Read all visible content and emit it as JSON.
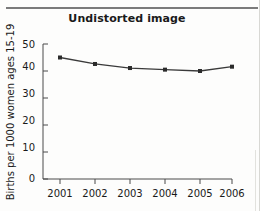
{
  "figure": {
    "title": "Undistorted image",
    "background_color": "#fdfdfc",
    "rule_color": "#7b7b7b"
  },
  "chart_data": {
    "type": "line",
    "title": "Undistorted image",
    "xlabel": "",
    "ylabel": "Births per 1000 women ages 15-19",
    "categories": [
      "2001",
      "2002",
      "2003",
      "2004",
      "2005",
      "2006"
    ],
    "x": [
      2001,
      2002,
      2003,
      2004,
      2005,
      2006
    ],
    "values": [
      45.0,
      42.6,
      41.1,
      40.5,
      40.0,
      41.6
    ],
    "series": [
      {
        "name": "Births per 1000 women ages 15-19",
        "values": [
          45.0,
          42.6,
          41.1,
          40.5,
          40.0,
          41.6
        ],
        "line_color": "#3a3a3a",
        "marker_color": "#2b2b2b",
        "marker": "square"
      }
    ],
    "ylim": [
      0,
      50
    ],
    "yticks": [
      0,
      10,
      20,
      30,
      40,
      50
    ],
    "ytick_labels": [
      "0",
      "10",
      "20",
      "30",
      "40",
      "50"
    ],
    "xtick_labels": [
      "2001",
      "2002",
      "2003",
      "2004",
      "2005",
      "2006"
    ],
    "grid": false,
    "legend": false,
    "legend_position": "none"
  }
}
